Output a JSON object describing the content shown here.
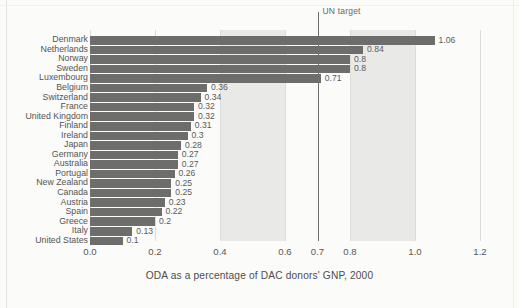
{
  "chart_data": {
    "type": "bar",
    "orientation": "horizontal",
    "title": "ODA as a percentage of DAC donors' GNP, 2000",
    "xlabel": "",
    "ylabel": "",
    "xlim": [
      0.0,
      1.2
    ],
    "grid": true,
    "legend": "none",
    "categories": [
      "Denmark",
      "Netherlands",
      "Norway",
      "Sweden",
      "Luxembourg",
      "Belgium",
      "Switzerland",
      "France",
      "United Kingdom",
      "Finland",
      "Ireland",
      "Japan",
      "Germany",
      "Australia",
      "Portugal",
      "New Zealand",
      "Canada",
      "Austria",
      "Spain",
      "Greece",
      "Italy",
      "United States"
    ],
    "values": [
      1.06,
      0.84,
      0.8,
      0.8,
      0.71,
      0.36,
      0.34,
      0.32,
      0.32,
      0.31,
      0.3,
      0.28,
      0.27,
      0.27,
      0.26,
      0.25,
      0.25,
      0.23,
      0.22,
      0.2,
      0.13,
      0.1
    ],
    "value_labels": [
      "1.06",
      "0.84",
      "0.8",
      "0.8",
      "0.71",
      "0.36",
      "0.34",
      "0.32",
      "0.32",
      "0.31",
      "0.3",
      "0.28",
      "0.27",
      "0.27",
      "0.26",
      "0.25",
      "0.25",
      "0.23",
      "0.22",
      "0.2",
      "0.13",
      "0.1"
    ],
    "xticks": [
      0.0,
      0.2,
      0.4,
      0.6,
      0.7,
      0.8,
      1.0,
      1.2
    ],
    "xtick_labels": [
      "0.0",
      "0.2",
      "0.4",
      "0.6",
      "0.7",
      "0.8",
      "1.0",
      "1.2"
    ],
    "annotations": [
      {
        "label": "UN target",
        "x": 0.7
      }
    ],
    "shaded_bands": [
      {
        "from": 0.4,
        "to": 0.6
      },
      {
        "from": 0.8,
        "to": 1.0
      }
    ],
    "colors": {
      "bar": "#6d6d6b",
      "band": "#e9e9e7",
      "gridline": "#dcdcda",
      "annotation_line": "#6f6d6b",
      "background": "#fbfbfa",
      "text": "#56544f"
    }
  }
}
